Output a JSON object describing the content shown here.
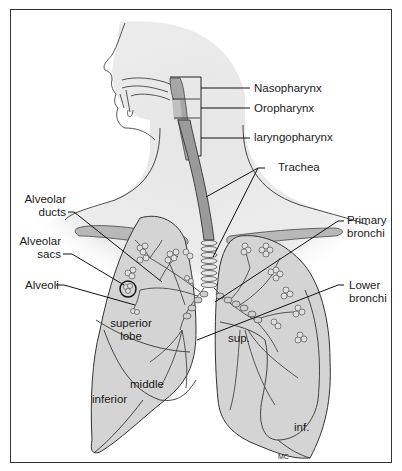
{
  "diagram": {
    "labels": {
      "nasopharynx": "Nasopharynx",
      "oropharynx": "Oropharynx",
      "laryngopharynx": "laryngopharynx",
      "trachea": "Trachea",
      "alveolar_ducts_1": "Alveolar",
      "alveolar_ducts_2": "ducts",
      "alveolar_sacs_1": "Alveolar",
      "alveolar_sacs_2": "sacs",
      "alveoli": "Alveoli",
      "primary_bronchi_1": "Primary",
      "primary_bronchi_2": "bronchi",
      "lower_bronchi_1": "Lower",
      "lower_bronchi_2": "bronchi",
      "superior_lobe_1": "superior",
      "superior_lobe_2": "lobe",
      "middle": "middle",
      "inferior": "inferior",
      "sup": "sup.",
      "inf": "inf.",
      "signature": "MC"
    },
    "colors": {
      "line": "#222222",
      "lung_fill": "#d4d4d4",
      "body_fill": "#e9e9e9",
      "trachea_fill": "#9a9a9a",
      "clavicle_fill": "#b8b8b8"
    }
  }
}
